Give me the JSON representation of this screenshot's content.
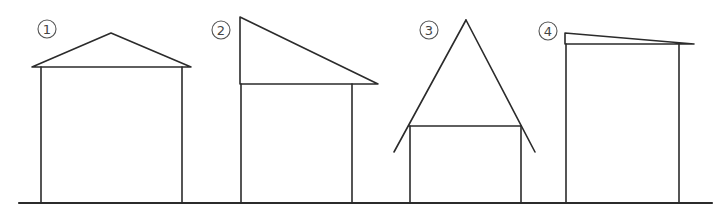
{
  "diagram": {
    "stroke_color": "#2b2b2b",
    "background": "#ffffff",
    "ground": {
      "x1": 19,
      "x2": 712,
      "y": 203
    },
    "houses": [
      {
        "label": "1",
        "badge": {
          "cx": 47,
          "cy": 29,
          "r": 9
        },
        "roof_type": "gable",
        "roof": "32,67 111,33 191,67 32,67",
        "walls": {
          "left": 41,
          "right": 182,
          "top": 67
        }
      },
      {
        "label": "2",
        "badge": {
          "cx": 221,
          "cy": 30,
          "r": 9
        },
        "roof_type": "shed-steep",
        "roof": "240,84 240,17 378,84 240,84",
        "walls": {
          "left": 241,
          "right": 352,
          "top": 84
        }
      },
      {
        "label": "3",
        "badge": {
          "cx": 429,
          "cy": 30,
          "r": 9
        },
        "roof_type": "a-frame",
        "roof_left": "394,152 466,20",
        "roof_right": "466,20 535,152",
        "ceiling": "409,126 521,126",
        "walls": {
          "left": 410,
          "right": 521,
          "top": 126
        }
      },
      {
        "label": "4",
        "badge": {
          "cx": 548,
          "cy": 31,
          "r": 9
        },
        "roof_type": "shed-shallow",
        "roof": "565,44 565,33 694,44 565,44",
        "walls": {
          "left": 566,
          "right": 679,
          "top": 44
        }
      }
    ]
  }
}
